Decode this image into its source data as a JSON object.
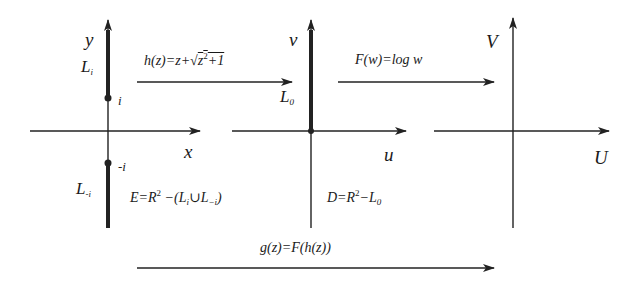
{
  "stroke_color": "#222222",
  "planes": [
    {
      "name": "z-plane",
      "x_axis_label": "x",
      "y_axis_label": "y",
      "upper_cut_label": "L",
      "upper_cut_sub": "i",
      "lower_cut_label": "L",
      "lower_cut_sub": "-i",
      "upper_point_label": "i",
      "lower_point_label": "-i",
      "domain_label_pre": "E=R",
      "domain_label_sup": "2",
      "domain_label_post1": " −(L",
      "domain_label_sub1": "i",
      "domain_label_mid": "∪L",
      "domain_label_sub2": "−i",
      "domain_label_close": ")"
    },
    {
      "name": "w-plane",
      "x_axis_label": "u",
      "y_axis_label": "v",
      "cut_label": "L",
      "cut_sub": "0",
      "domain_label_pre": "D=R",
      "domain_label_sup": "2",
      "domain_label_post": "−L",
      "domain_label_sub": "0"
    },
    {
      "name": "W-plane",
      "x_axis_label": "U",
      "y_axis_label": "V"
    }
  ],
  "maps": {
    "h": {
      "pre": "h(z)=z+√",
      "radicand_base": "z",
      "radicand_sup": "2",
      "radicand_post": "+1"
    },
    "F": {
      "label": "F(w)=log w"
    },
    "g": {
      "label": "g(z)=F(h(z))"
    }
  }
}
